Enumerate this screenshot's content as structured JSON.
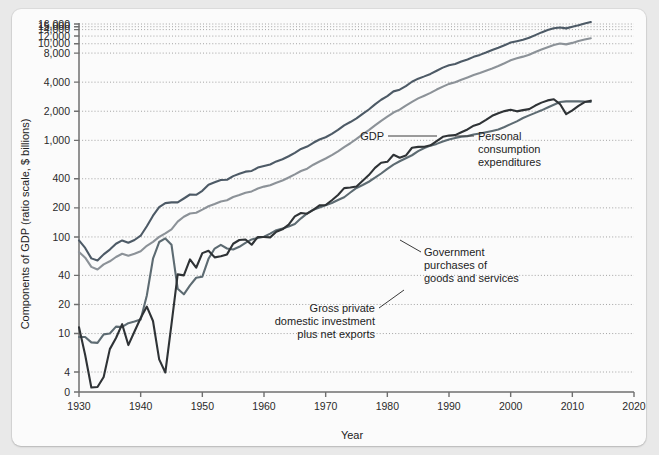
{
  "figure": {
    "background_color": "#e9e9e9",
    "panel_color": "#fbfbfb"
  },
  "chart_data": {
    "type": "line",
    "title": "",
    "xlabel": "Year",
    "ylabel": "Components of GDP (ratio scale, $ billions)",
    "scale": "log",
    "grid": true,
    "legend_position": "inline-annotations",
    "xlim": [
      1930,
      2020
    ],
    "ylim": [
      0,
      16000
    ],
    "xticks": [
      1930,
      1940,
      1950,
      1960,
      1970,
      1980,
      1990,
      2000,
      2010,
      2020
    ],
    "xtick_labels": [
      "1930",
      "1940",
      "1950",
      "1960",
      "1970",
      "1980",
      "1990",
      "2000",
      "2010",
      "2020"
    ],
    "yticks": [
      0,
      4,
      10,
      20,
      40,
      100,
      200,
      400,
      1000,
      2000,
      4000,
      8000,
      10000,
      12000,
      14000,
      15000,
      16000
    ],
    "ytick_labels": [
      "0",
      "4",
      "10",
      "20",
      "40",
      "100",
      "200",
      "400",
      "1,000",
      "2,000",
      "4,000",
      "8,000",
      "10,000",
      "12,000",
      "14,000",
      "15,000",
      "16,000"
    ],
    "series": [
      {
        "name": "GDP",
        "color": "#4d5a66",
        "width": 2.1,
        "label": "GDP",
        "x": [
          1930,
          1931,
          1932,
          1933,
          1934,
          1935,
          1936,
          1937,
          1938,
          1939,
          1940,
          1941,
          1942,
          1943,
          1944,
          1945,
          1946,
          1947,
          1948,
          1949,
          1950,
          1951,
          1952,
          1953,
          1954,
          1955,
          1956,
          1957,
          1958,
          1959,
          1960,
          1961,
          1962,
          1963,
          1964,
          1965,
          1966,
          1967,
          1968,
          1969,
          1970,
          1971,
          1972,
          1973,
          1974,
          1975,
          1976,
          1977,
          1978,
          1979,
          1980,
          1981,
          1982,
          1983,
          1984,
          1985,
          1986,
          1987,
          1988,
          1989,
          1990,
          1991,
          1992,
          1993,
          1994,
          1995,
          1996,
          1997,
          1998,
          1999,
          2000,
          2001,
          2002,
          2003,
          2004,
          2005,
          2006,
          2007,
          2008,
          2009,
          2010,
          2011,
          2012,
          2013
        ],
        "y": [
          92,
          77,
          60,
          57,
          66,
          74,
          85,
          92,
          87,
          93,
          103,
          129,
          166,
          203,
          224,
          228,
          228,
          250,
          275,
          273,
          300,
          347,
          368,
          389,
          391,
          426,
          450,
          474,
          482,
          522,
          543,
          563,
          605,
          638,
          685,
          743,
          815,
          862,
          943,
          1020,
          1076,
          1168,
          1282,
          1429,
          1546,
          1688,
          1878,
          2086,
          2357,
          2632,
          2863,
          3211,
          3345,
          3638,
          4041,
          4347,
          4590,
          4870,
          5253,
          5658,
          5980,
          6174,
          6539,
          6879,
          7309,
          7664,
          8100,
          8609,
          9089,
          9661,
          10285,
          10622,
          10978,
          11511,
          12275,
          13094,
          13856,
          14478,
          14719,
          14419,
          14964,
          15518,
          16163,
          16768
        ]
      },
      {
        "name": "Personal consumption expenditures",
        "color": "#8c9298",
        "width": 2.1,
        "label": "Personal\nconsumption\nexpenditures",
        "x": [
          1930,
          1931,
          1932,
          1933,
          1934,
          1935,
          1936,
          1937,
          1938,
          1939,
          1940,
          1941,
          1942,
          1943,
          1944,
          1945,
          1946,
          1947,
          1948,
          1949,
          1950,
          1951,
          1952,
          1953,
          1954,
          1955,
          1956,
          1957,
          1958,
          1959,
          1960,
          1961,
          1962,
          1963,
          1964,
          1965,
          1966,
          1967,
          1968,
          1969,
          1970,
          1971,
          1972,
          1973,
          1974,
          1975,
          1976,
          1977,
          1978,
          1979,
          1980,
          1981,
          1982,
          1983,
          1984,
          1985,
          1986,
          1987,
          1988,
          1989,
          1990,
          1991,
          1992,
          1993,
          1994,
          1995,
          1996,
          1997,
          1998,
          1999,
          2000,
          2001,
          2002,
          2003,
          2004,
          2005,
          2006,
          2007,
          2008,
          2009,
          2010,
          2011,
          2012,
          2013
        ],
        "y": [
          70,
          61,
          49,
          46,
          52,
          56,
          62,
          67,
          64,
          67,
          71,
          81,
          89,
          100,
          109,
          120,
          144,
          162,
          175,
          178,
          192,
          208,
          219,
          233,
          240,
          259,
          271,
          286,
          296,
          317,
          332,
          343,
          364,
          384,
          412,
          444,
          481,
          509,
          559,
          604,
          648,
          702,
          770,
          852,
          933,
          1034,
          1152,
          1278,
          1428,
          1592,
          1757,
          1941,
          2077,
          2290,
          2503,
          2720,
          2899,
          3100,
          3353,
          3598,
          3840,
          3986,
          4235,
          4477,
          4743,
          4976,
          5257,
          5547,
          5880,
          6282,
          6739,
          7055,
          7351,
          7704,
          8196,
          8694,
          9207,
          9710,
          10035,
          9845,
          10202,
          10689,
          11051,
          11392
        ]
      },
      {
        "name": "Government purchases of goods and services",
        "color": "#5d6b72",
        "width": 2.1,
        "label": "Government\npurchases of\ngoods and services",
        "x": [
          1930,
          1931,
          1932,
          1933,
          1934,
          1935,
          1936,
          1937,
          1938,
          1939,
          1940,
          1941,
          1942,
          1943,
          1944,
          1945,
          1946,
          1947,
          1948,
          1949,
          1950,
          1951,
          1952,
          1953,
          1954,
          1955,
          1956,
          1957,
          1958,
          1959,
          1960,
          1961,
          1962,
          1963,
          1964,
          1965,
          1966,
          1967,
          1968,
          1969,
          1970,
          1971,
          1972,
          1973,
          1974,
          1975,
          1976,
          1977,
          1978,
          1979,
          1980,
          1981,
          1982,
          1983,
          1984,
          1985,
          1986,
          1987,
          1988,
          1989,
          1990,
          1991,
          1992,
          1993,
          1994,
          1995,
          1996,
          1997,
          1998,
          1999,
          2000,
          2001,
          2002,
          2003,
          2004,
          2005,
          2006,
          2007,
          2008,
          2009,
          2010,
          2011,
          2012,
          2013
        ],
        "y": [
          9.2,
          9.2,
          8.1,
          8.0,
          9.8,
          10.0,
          11.8,
          11.7,
          12.8,
          13.3,
          14.0,
          24.8,
          59.5,
          88.6,
          96.5,
          83.0,
          29.1,
          25.5,
          31.5,
          37.8,
          38.8,
          59.4,
          75.8,
          82.8,
          75.9,
          74.2,
          79.0,
          86.8,
          94.2,
          97.6,
          100.6,
          108.3,
          117.6,
          122.5,
          128.3,
          136.3,
          155.9,
          175.6,
          191.5,
          201.8,
          212.7,
          224.3,
          241.5,
          257.7,
          288.3,
          321.4,
          345.1,
          372.6,
          410.1,
          453.6,
          507.1,
          561.1,
          607.6,
          652.3,
          700.8,
          772.3,
          833.0,
          881.5,
          918.7,
          971.9,
          1020.0,
          1055.0,
          1090.7,
          1105.9,
          1148.3,
          1176.8,
          1213.4,
          1251.9,
          1295.4,
          1374.0,
          1470.7,
          1572.7,
          1703.3,
          1812.1,
          1922.8,
          2044.0,
          2185.5,
          2338.6,
          2490.5,
          2532.1,
          2537.1,
          2531.9,
          2512.9,
          2503.2
        ]
      },
      {
        "name": "Gross private domestic investment plus net exports",
        "color": "#2f3336",
        "width": 2.1,
        "label": "Gross private\ndomestic investment\nplus net exports",
        "x": [
          1930,
          1931,
          1932,
          1933,
          1934,
          1935,
          1936,
          1937,
          1938,
          1939,
          1940,
          1941,
          1942,
          1943,
          1944,
          1945,
          1946,
          1947,
          1948,
          1949,
          1950,
          1951,
          1952,
          1953,
          1954,
          1955,
          1956,
          1957,
          1958,
          1959,
          1960,
          1961,
          1962,
          1963,
          1964,
          1965,
          1966,
          1967,
          1968,
          1969,
          1970,
          1971,
          1972,
          1973,
          1974,
          1975,
          1976,
          1977,
          1978,
          1979,
          1980,
          1981,
          1982,
          1983,
          1984,
          1985,
          1986,
          1987,
          1988,
          1989,
          1990,
          1991,
          1992,
          1993,
          1994,
          1995,
          1996,
          1997,
          1998,
          1999,
          2000,
          2001,
          2002,
          2003,
          2004,
          2005,
          2006,
          2007,
          2008,
          2009,
          2010,
          2011,
          2012,
          2013
        ],
        "y": [
          11.6,
          6.0,
          0.9,
          1.0,
          3.0,
          6.9,
          9.0,
          12.5,
          7.6,
          10.5,
          14.5,
          19.0,
          13.5,
          5.4,
          3.9,
          12.5,
          41.0,
          40.0,
          58.5,
          48.0,
          68.0,
          72.0,
          61.5,
          63.0,
          66.0,
          85.0,
          93.0,
          94.0,
          83.0,
          100.0,
          100.0,
          99.0,
          113.0,
          120.0,
          134.0,
          163.0,
          177.0,
          174.0,
          191.0,
          212.0,
          214.0,
          240.0,
          272.0,
          320.0,
          325.0,
          333.0,
          381.0,
          437.0,
          519.0,
          586.0,
          599.0,
          709.0,
          660.0,
          696.0,
          838.0,
          855.0,
          858.0,
          888.0,
          982.0,
          1088.0,
          1120.0,
          1133.0,
          1213.0,
          1296.0,
          1418.0,
          1488.0,
          1629.0,
          1793.0,
          1910.0,
          2006.0,
          2075.0,
          1995.0,
          2054.0,
          2104.0,
          2291.0,
          2456.0,
          2590.0,
          2660.0,
          2374.0,
          1869.0,
          2043.0,
          2274.0,
          2491.0,
          2573.0
        ]
      }
    ],
    "annotations": [
      {
        "id": "gdp-label",
        "text": "GDP"
      },
      {
        "id": "pce-label",
        "lines": [
          "Personal",
          "consumption",
          "expenditures"
        ]
      },
      {
        "id": "gov-label",
        "lines": [
          "Government",
          "purchases of",
          "goods and services"
        ]
      },
      {
        "id": "inv-label",
        "lines": [
          "Gross private",
          "domestic investment",
          "plus net exports"
        ]
      }
    ]
  }
}
